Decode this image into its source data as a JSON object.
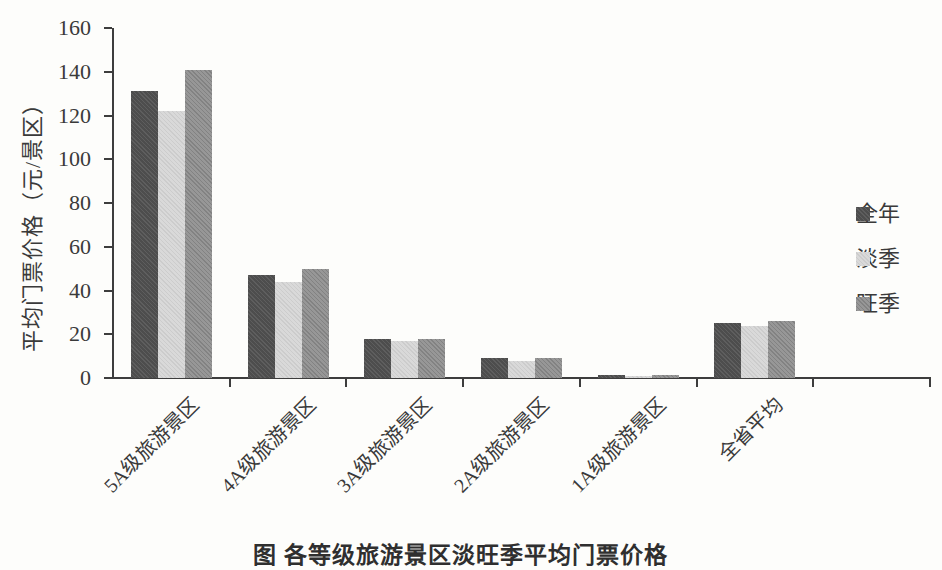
{
  "figure": {
    "y_axis_label": "平均门票价格（元/景区）",
    "caption_partial": "图 各等级旅游景区淡旺季平均门票价格"
  },
  "legend": {
    "items": [
      {
        "label": "全年"
      },
      {
        "label": "淡季"
      },
      {
        "label": "旺季"
      }
    ]
  },
  "chart_data": {
    "type": "bar",
    "title": "",
    "xlabel": "",
    "ylabel": "平均门票价格（元/景区）",
    "ylim": [
      0,
      160
    ],
    "yticks": [
      0,
      20,
      40,
      60,
      80,
      100,
      120,
      140,
      160
    ],
    "grid": false,
    "legend_position": "right",
    "categories": [
      "5A级旅游景区",
      "4A级旅游景区",
      "3A级旅游景区",
      "2A级旅游景区",
      "1A级旅游景区",
      "全省平均"
    ],
    "series": [
      {
        "name": "全年",
        "color": "#525252",
        "values": [
          131,
          47,
          18,
          9,
          1.5,
          25
        ]
      },
      {
        "name": "淡季",
        "color": "#d7d7d7",
        "values": [
          122,
          44,
          17,
          8,
          1,
          24
        ]
      },
      {
        "name": "旺季",
        "color": "#919191",
        "values": [
          141,
          50,
          18,
          9,
          1.5,
          26
        ]
      }
    ]
  }
}
